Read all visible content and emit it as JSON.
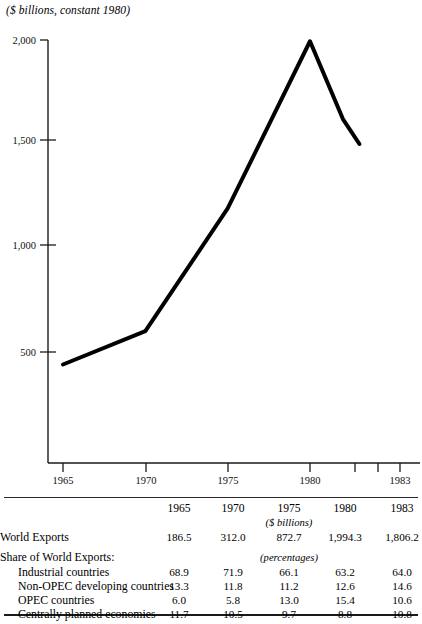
{
  "chart": {
    "title": "($ billions, constant 1980)",
    "y_ticks": [
      "2,000",
      "1,500",
      "1,000",
      "500"
    ],
    "x_ticks": [
      "1965",
      "1970",
      "1975",
      "1980",
      "1983"
    ]
  },
  "chart_data": {
    "type": "line",
    "title": "($ billions, constant 1980)",
    "xlabel": "",
    "ylabel": "$ billions, constant 1980",
    "x": [
      1965,
      1970,
      1975,
      1980,
      1982,
      1983
    ],
    "values": [
      440,
      600,
      1190,
      1994,
      1620,
      1500
    ],
    "series": [
      {
        "name": "World Exports (constant 1980 $ billions)",
        "values": [
          440,
          600,
          1190,
          1994,
          1620,
          1500
        ]
      }
    ],
    "xlim": [
      1964,
      1984
    ],
    "ylim": [
      0,
      2000
    ],
    "ytick_values": [
      2000,
      1500,
      1000,
      500
    ],
    "xtick_values": [
      1965,
      1970,
      1975,
      1980,
      1981,
      1982,
      1983
    ],
    "xtick_labels": [
      "1965",
      "1970",
      "1975",
      "1980",
      "",
      "",
      "1983"
    ],
    "grid": false,
    "legend": "none",
    "line_color": "#000000",
    "line_width": 4
  },
  "table": {
    "columns": [
      "",
      "1965",
      "1970",
      "1975",
      "1980",
      "1983"
    ],
    "unit_billions": "($ billions)",
    "unit_percentages": "(percentages)",
    "rows": [
      {
        "label": "World Exports",
        "values": [
          "186.5",
          "312.0",
          "872.7",
          "1,994.3",
          "1,806.2"
        ]
      },
      {
        "label": "Share of World Exports:",
        "values": [
          "",
          "",
          "",
          "",
          ""
        ]
      },
      {
        "label": "Industrial countries",
        "values": [
          "68.9",
          "71.9",
          "66.1",
          "63.2",
          "64.0"
        ]
      },
      {
        "label": "Non-OPEC developing countries",
        "values": [
          "13.3",
          "11.8",
          "11.2",
          "12.6",
          "14.6"
        ]
      },
      {
        "label": "OPEC countries",
        "values": [
          "6.0",
          "5.8",
          "13.0",
          "15.4",
          "10.6"
        ]
      },
      {
        "label": "Centrally planned  economies",
        "values": [
          "11.7",
          "10.5",
          "9.7",
          "8.8",
          "10.8"
        ]
      }
    ]
  }
}
